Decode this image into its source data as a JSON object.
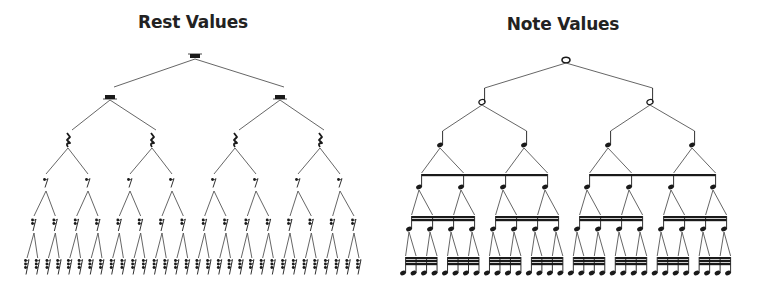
{
  "titles": {
    "rest": "Rest Values",
    "note": "Note Values"
  },
  "rest_tree": {
    "levels": [
      {
        "name": "whole-rest",
        "y": 56,
        "xs": [
          195
        ]
      },
      {
        "name": "half-rest",
        "y": 97,
        "xs": [
          110,
          280
        ]
      },
      {
        "name": "quarter-rest",
        "y": 140,
        "xs": [
          68,
          152,
          235,
          320
        ]
      },
      {
        "name": "eighth-rest",
        "y": 183,
        "xs": [
          46,
          88,
          130,
          172,
          214,
          256,
          298,
          340
        ]
      },
      {
        "name": "sixteenth-rest",
        "y": 225,
        "count": 16,
        "x0": 34,
        "x1": 354
      },
      {
        "name": "thirty-second-rest",
        "y": 267,
        "count": 32,
        "x0": 27,
        "x1": 359
      }
    ]
  },
  "note_tree": {
    "levels": [
      {
        "name": "whole-note",
        "y": 60,
        "xs": [
          566
        ]
      },
      {
        "name": "half-note",
        "y": 102,
        "xs": [
          482,
          650
        ]
      },
      {
        "name": "quarter-note",
        "y": 145,
        "xs": [
          440,
          524,
          608,
          692
        ]
      },
      {
        "name": "eighth-note",
        "y": 187,
        "beam_y": 174,
        "beams": 1,
        "groups": 2,
        "x0": 419,
        "x1": 713
      },
      {
        "name": "sixteenth-note",
        "y": 229,
        "beam_y": 216,
        "beams": 2,
        "groups": 4,
        "x0": 409,
        "x1": 724
      },
      {
        "name": "thirty-second-note",
        "y": 273,
        "beam_y": 257,
        "beams": 3,
        "groups": 8,
        "x0": 403,
        "x1": 728
      }
    ]
  },
  "colors": {
    "ink": "#1a1a1a",
    "line": "#555555"
  }
}
